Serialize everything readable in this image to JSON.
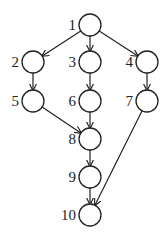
{
  "diagram": {
    "type": "directed-graph",
    "node_radius": 11,
    "nodes": [
      {
        "id": "1",
        "label": "1",
        "x": 90,
        "y": 25
      },
      {
        "id": "2",
        "label": "2",
        "x": 33,
        "y": 62
      },
      {
        "id": "3",
        "label": "3",
        "x": 90,
        "y": 62
      },
      {
        "id": "4",
        "label": "4",
        "x": 147,
        "y": 62
      },
      {
        "id": "5",
        "label": "5",
        "x": 33,
        "y": 101
      },
      {
        "id": "6",
        "label": "6",
        "x": 90,
        "y": 101
      },
      {
        "id": "7",
        "label": "7",
        "x": 147,
        "y": 101
      },
      {
        "id": "8",
        "label": "8",
        "x": 90,
        "y": 139
      },
      {
        "id": "9",
        "label": "9",
        "x": 90,
        "y": 177
      },
      {
        "id": "10",
        "label": "10",
        "x": 90,
        "y": 215
      }
    ],
    "edges": [
      {
        "from": "1",
        "to": "2"
      },
      {
        "from": "1",
        "to": "3"
      },
      {
        "from": "1",
        "to": "4"
      },
      {
        "from": "2",
        "to": "5"
      },
      {
        "from": "3",
        "to": "6"
      },
      {
        "from": "4",
        "to": "7"
      },
      {
        "from": "5",
        "to": "8"
      },
      {
        "from": "6",
        "to": "8"
      },
      {
        "from": "8",
        "to": "9"
      },
      {
        "from": "9",
        "to": "10"
      },
      {
        "from": "7",
        "to": "10"
      }
    ]
  }
}
